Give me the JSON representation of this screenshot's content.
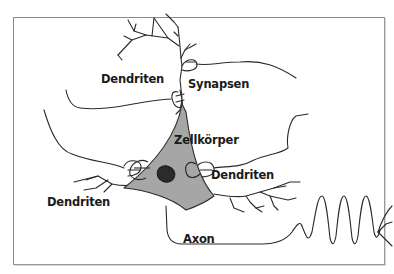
{
  "diagram": {
    "labels": {
      "dendrites_top": "Dendriten",
      "synapses": "Synapsen",
      "cell_body": "Zellkörper",
      "dendrites_right": "Dendriten",
      "dendrites_left": "Dendriten",
      "axon": "Axon"
    },
    "colors": {
      "line": "#2a2a2a",
      "cell_body_fill": "#a6a6a6",
      "nucleus_fill": "#2b2b2b",
      "frame": "#8a8a8a",
      "background": "#ffffff"
    }
  }
}
